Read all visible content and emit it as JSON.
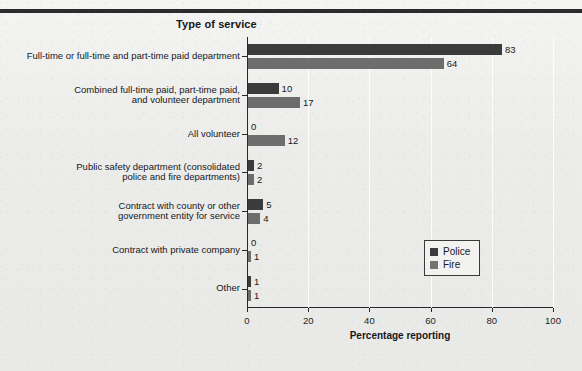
{
  "chart_data": {
    "type": "bar",
    "orientation": "horizontal",
    "title": "Type of service",
    "xlabel": "Percentage reporting",
    "ylabel": "",
    "xlim": [
      0,
      100
    ],
    "xticks": [
      0,
      20,
      40,
      60,
      80,
      100
    ],
    "grid": "vertical-only",
    "legend_position": "right-lower",
    "categories": [
      "Full-time or full-time and part-time paid department",
      "Combined full-time paid, part-time paid,\nand volunteer department",
      "All volunteer",
      "Public safety department (consolidated\npolice and fire departments)",
      "Contract with county or other\ngovernment entity for service",
      "Contract with private company",
      "Other"
    ],
    "series": [
      {
        "name": "Police",
        "color": "#3b3b3b",
        "values": [
          83,
          10,
          0,
          2,
          5,
          0,
          1
        ]
      },
      {
        "name": "Fire",
        "color": "#6d6d6d",
        "values": [
          64,
          17,
          12,
          2,
          4,
          1,
          1
        ]
      }
    ]
  },
  "legend": {
    "entries": [
      {
        "label": "Police",
        "swatch": "police"
      },
      {
        "label": "Fire",
        "swatch": "fire"
      }
    ]
  }
}
